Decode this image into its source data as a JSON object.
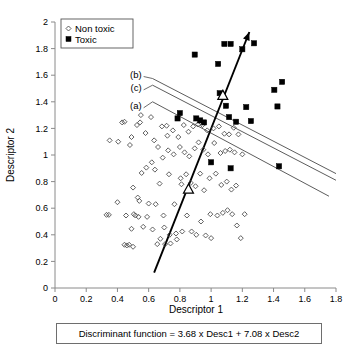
{
  "chart_data": {
    "type": "scatter",
    "title": "",
    "xlabel": "Descriptor 1",
    "ylabel": "Descriptor 2",
    "xlim": [
      0,
      1.8
    ],
    "ylim": [
      0,
      2
    ],
    "xticks": [
      "0",
      "0.2",
      "0.4",
      "0.6",
      "0.8",
      "1",
      "1.2",
      "1.4",
      "1.6",
      "1.8"
    ],
    "yticks": [
      "0",
      "0.2",
      "0.4",
      "0.6",
      "0.8",
      "1",
      "1.2",
      "1.4",
      "1.6",
      "1.8",
      "2"
    ],
    "grid": false,
    "legend_position": "top-left",
    "legend": [
      {
        "label": "Non toxic",
        "marker": "open-diamond"
      },
      {
        "label": "Toxic",
        "marker": "filled-square"
      }
    ],
    "series": [
      {
        "name": "Non toxic",
        "marker": "open-diamond",
        "points": [
          [
            0.33,
            0.55
          ],
          [
            0.345,
            0.55
          ],
          [
            0.35,
            1.11
          ],
          [
            0.4,
            0.645
          ],
          [
            0.405,
            1.1
          ],
          [
            0.43,
            1.245
          ],
          [
            0.445,
            1.25
          ],
          [
            0.455,
            0.545
          ],
          [
            0.46,
            0.32
          ],
          [
            0.445,
            0.325
          ],
          [
            0.475,
            0.325
          ],
          [
            0.48,
            1.075
          ],
          [
            0.49,
            1.135
          ],
          [
            0.49,
            0.445
          ],
          [
            0.5,
            0.755
          ],
          [
            0.505,
            0.555
          ],
          [
            0.5,
            0.31
          ],
          [
            0.515,
            0.545
          ],
          [
            0.525,
            1.225
          ],
          [
            0.53,
            0.68
          ],
          [
            0.535,
            0.535
          ],
          [
            0.54,
            0.655
          ],
          [
            0.55,
            1.3
          ],
          [
            0.545,
            1.245
          ],
          [
            0.555,
            0.865
          ],
          [
            0.565,
            0.46
          ],
          [
            0.58,
            1.165
          ],
          [
            0.585,
            0.905
          ],
          [
            0.59,
            0.535
          ],
          [
            0.6,
            0.635
          ],
          [
            0.615,
            1.285
          ],
          [
            0.62,
            0.945
          ],
          [
            0.625,
            0.44
          ],
          [
            0.635,
            1.11
          ],
          [
            0.64,
            0.89
          ],
          [
            0.645,
            0.63
          ],
          [
            0.655,
            0.33
          ],
          [
            0.66,
            1.06
          ],
          [
            0.67,
            0.785
          ],
          [
            0.675,
            0.37
          ],
          [
            0.685,
            1.215
          ],
          [
            0.69,
            0.98
          ],
          [
            0.695,
            0.545
          ],
          [
            0.7,
            0.455
          ],
          [
            0.705,
            0.33
          ],
          [
            0.715,
            1.22
          ],
          [
            0.72,
            1.145
          ],
          [
            0.725,
            1.035
          ],
          [
            0.73,
            0.855
          ],
          [
            0.735,
            0.4
          ],
          [
            0.74,
            0.335
          ],
          [
            0.755,
            1.185
          ],
          [
            0.76,
            1.005
          ],
          [
            0.765,
            0.63
          ],
          [
            0.775,
            0.41
          ],
          [
            0.78,
            0.365
          ],
          [
            0.79,
            1.135
          ],
          [
            0.8,
            1.06
          ],
          [
            0.805,
            0.825
          ],
          [
            0.81,
            0.78
          ],
          [
            0.815,
            0.425
          ],
          [
            0.825,
            1.225
          ],
          [
            0.83,
            1.02
          ],
          [
            0.84,
            0.855
          ],
          [
            0.845,
            0.545
          ],
          [
            0.855,
            1.175
          ],
          [
            0.86,
            0.99
          ],
          [
            0.87,
            0.79
          ],
          [
            0.875,
            0.425
          ],
          [
            0.885,
            1.215
          ],
          [
            0.895,
            1.05
          ],
          [
            0.9,
            0.765
          ],
          [
            0.905,
            0.4
          ],
          [
            0.915,
            1.23
          ],
          [
            0.92,
            1.095
          ],
          [
            0.93,
            0.86
          ],
          [
            0.935,
            0.5
          ],
          [
            0.945,
            1.225
          ],
          [
            0.95,
            1.04
          ],
          [
            0.955,
            0.735
          ],
          [
            0.965,
            0.395
          ],
          [
            0.975,
            1.185
          ],
          [
            0.98,
            1.005
          ],
          [
            0.99,
            0.825
          ],
          [
            0.995,
            0.555
          ],
          [
            1.0,
            0.375
          ],
          [
            1.015,
            1.2
          ],
          [
            1.02,
            1.09
          ],
          [
            1.03,
            0.86
          ],
          [
            1.04,
            0.545
          ],
          [
            1.05,
            1.215
          ],
          [
            1.06,
            1.015
          ],
          [
            1.065,
            0.775
          ],
          [
            1.075,
            0.565
          ],
          [
            1.085,
            1.16
          ],
          [
            1.09,
            1.03
          ],
          [
            1.1,
            0.8
          ],
          [
            1.105,
            0.585
          ],
          [
            1.115,
            1.155
          ],
          [
            1.12,
            1.04
          ],
          [
            1.13,
            0.74
          ],
          [
            1.135,
            0.555
          ],
          [
            1.145,
            1.205
          ],
          [
            1.15,
            1.02
          ],
          [
            1.16,
            0.77
          ],
          [
            1.165,
            0.47
          ],
          [
            1.175,
            1.155
          ],
          [
            1.19,
            0.375
          ],
          [
            1.2,
            1.005
          ],
          [
            1.215,
            0.555
          ]
        ]
      },
      {
        "name": "Toxic",
        "marker": "filled-square",
        "points": [
          [
            0.785,
            1.275
          ],
          [
            0.8,
            1.315
          ],
          [
            0.895,
            1.755
          ],
          [
            0.905,
            1.275
          ],
          [
            0.93,
            1.26
          ],
          [
            0.955,
            1.245
          ],
          [
            1.0,
            0.945
          ],
          [
            1.045,
            1.685
          ],
          [
            1.055,
            1.465
          ],
          [
            1.085,
            1.835
          ],
          [
            1.095,
            1.37
          ],
          [
            1.115,
            1.285
          ],
          [
            1.125,
            1.835
          ],
          [
            1.125,
            0.9
          ],
          [
            1.16,
            1.25
          ],
          [
            1.2,
            1.795
          ],
          [
            1.225,
            1.36
          ],
          [
            1.255,
            1.255
          ],
          [
            1.275,
            1.84
          ],
          [
            1.405,
            1.49
          ],
          [
            1.425,
            1.365
          ],
          [
            1.455,
            1.55
          ],
          [
            1.435,
            0.915
          ]
        ]
      },
      {
        "name": "Centroids",
        "marker": "open-triangle",
        "points": [
          [
            1.075,
            1.45
          ],
          [
            0.855,
            0.745
          ]
        ]
      }
    ],
    "annotations": [
      {
        "label": "(b)",
        "x": 0.555,
        "y": 1.605,
        "line": "boundary-b"
      },
      {
        "label": "(c)",
        "x": 0.555,
        "y": 1.505,
        "line": "boundary-c"
      },
      {
        "label": "(a)",
        "x": 0.555,
        "y": 1.37,
        "line": "boundary-a"
      }
    ],
    "boundary_lines": [
      {
        "name": "boundary-b",
        "from": [
          0.625,
          1.575
        ],
        "to": [
          1.8,
          0.86
        ]
      },
      {
        "name": "boundary-c",
        "from": [
          0.625,
          1.525
        ],
        "to": [
          1.8,
          0.81
        ]
      },
      {
        "name": "boundary-a",
        "from": [
          0.625,
          1.4
        ],
        "to": [
          1.755,
          0.69
        ]
      }
    ],
    "discriminant_vector": {
      "from": [
        0.635,
        0.115
      ],
      "to": [
        1.245,
        1.925
      ],
      "arrow": true
    }
  },
  "caption": {
    "text": "Discriminant function = 3.68 x Desc1 + 7.08 x Desc2"
  }
}
